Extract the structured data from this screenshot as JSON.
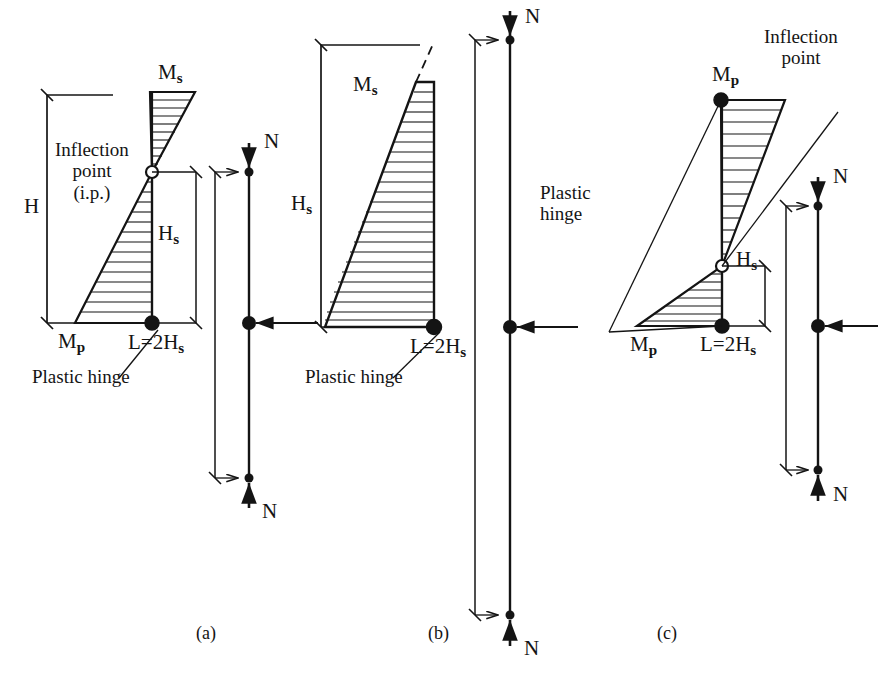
{
  "figure": {
    "background_color": "#ffffff",
    "line_color": "#141414",
    "width": 880,
    "height": 683
  },
  "panels": [
    {
      "id": "a",
      "caption": "(a)",
      "labels": {
        "moment_top": "M",
        "moment_top_sub": "s",
        "moment_base": "M",
        "moment_base_sub": "p",
        "height": "H",
        "shear_height": "H",
        "shear_height_sub": "s",
        "length": "L=2H",
        "length_sub": "s",
        "inflection": "Inflection",
        "inflection_line2": "point",
        "inflection_line3": "(i.p.)",
        "plastic_hinge": "Plastic hinge",
        "axial_load": "N",
        "axial_load_bottom": "N"
      }
    },
    {
      "id": "b",
      "caption": "(b)",
      "labels": {
        "moment_top": "M",
        "moment_top_sub": "s",
        "shear_height": "H",
        "shear_height_sub": "s",
        "length": "L=2H",
        "length_sub": "s",
        "plastic_hinge": "Plastic hinge",
        "axial_load": "N",
        "axial_load_bottom": "N"
      }
    },
    {
      "id": "c",
      "caption": "(c)",
      "labels": {
        "moment_top": "M",
        "moment_top_sub": "p",
        "moment_base": "M",
        "moment_base_sub": "p",
        "shear_height": "H",
        "shear_height_sub": "s",
        "length": "L=2H",
        "length_sub": "s",
        "inflection": "Inflection",
        "inflection_line2": "point",
        "plastic_hinge": "Plastic",
        "plastic_hinge_line2": "hinge",
        "axial_load": "N",
        "axial_load_bottom": "N"
      }
    }
  ],
  "markers": {
    "plastic_hinge_symbol": "filled-circle",
    "inflection_point_symbol": "open-circle",
    "axial_load_symbol": "arrow",
    "support_symbol": "pin-roller"
  }
}
